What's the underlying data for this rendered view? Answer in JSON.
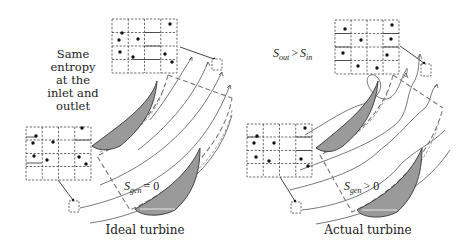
{
  "figure": {
    "panels": [
      {
        "id": "ideal",
        "caption": "Ideal turbine",
        "annotation": "Same entropy at the inlet and outlet",
        "annotation_lines": [
          "Same",
          "entropy",
          "at the",
          "inlet and",
          "outlet"
        ],
        "entropy_label": {
          "symbol": "S",
          "subscript": "gen",
          "relation": "= 0"
        },
        "streamlines": "smooth parallel curved arrows"
      },
      {
        "id": "actual",
        "caption": "Actual turbine",
        "annotation": "S_out > S_in",
        "annotation_parts": {
          "lhs_symbol": "S",
          "lhs_sub": "out",
          "op": ">",
          "rhs_symbol": "S",
          "rhs_sub": "in"
        },
        "entropy_label": {
          "symbol": "S",
          "subscript": "gen",
          "relation": "> 0"
        },
        "streamlines": "irregular wavy arrows with vortex loop"
      }
    ],
    "colors": {
      "blade_fill": "#9a9a9a",
      "line": "#555555",
      "control_volume": "#777777",
      "dot": "#111111"
    }
  }
}
